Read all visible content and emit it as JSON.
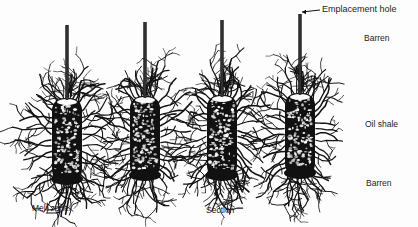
{
  "labels": {
    "emplacement_hole": "Emplacement hole",
    "barren_top": "Barren",
    "oil_shale": "Oil shale",
    "barren_bottom": "Barren",
    "melt_zone": "Melt zone",
    "section": "Section"
  },
  "colors": {
    "ink": "#111111",
    "background": "#fdfdfd"
  },
  "chambers": [
    {
      "x": 67,
      "shaft_top": 25,
      "top": 98,
      "bottom": 182,
      "width": 30
    },
    {
      "x": 145,
      "shaft_top": 22,
      "top": 96,
      "bottom": 178,
      "width": 30
    },
    {
      "x": 222,
      "shaft_top": 20,
      "top": 95,
      "bottom": 178,
      "width": 30
    },
    {
      "x": 300,
      "shaft_top": 14,
      "top": 93,
      "bottom": 176,
      "width": 30
    }
  ]
}
